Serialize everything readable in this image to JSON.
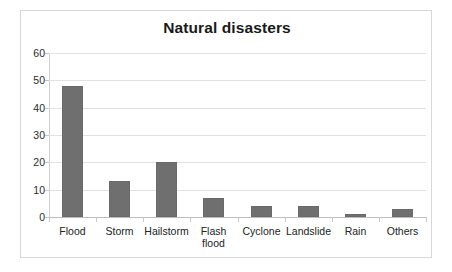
{
  "chart_data": {
    "type": "bar",
    "title": "Natural disasters",
    "xlabel": "",
    "ylabel": "",
    "ylim": [
      0,
      60
    ],
    "yticks": [
      0,
      10,
      20,
      30,
      40,
      50,
      60
    ],
    "ytick_labels": [
      "0",
      "10",
      "20",
      "30",
      "40",
      "50",
      "60"
    ],
    "grid": true,
    "legend": "none",
    "bar_color": "#6f6f6f",
    "categories": [
      "Flood",
      "Storm",
      "Hailstorm",
      "Flash flood",
      "Cyclone",
      "Landslide",
      "Rain",
      "Others"
    ],
    "category_labels": [
      "Flood",
      "Storm",
      "Hailstorm",
      "Flash\nflood",
      "Cyclone",
      "Landslide",
      "Rain",
      "Others"
    ],
    "values": [
      48,
      13,
      20,
      7,
      4,
      4,
      1,
      3
    ]
  }
}
